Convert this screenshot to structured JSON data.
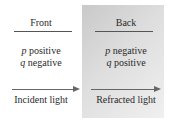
{
  "front": {
    "title": "Front",
    "p_symbol": "p",
    "p_label": " positive",
    "q_symbol": "q",
    "q_label": " negative",
    "caption": "Incident light"
  },
  "back": {
    "title": "Back",
    "p_symbol": "p",
    "p_label": " negative",
    "q_symbol": "q",
    "q_label": " positive",
    "caption": "Refracted light"
  },
  "colors": {
    "panel_dark": "#c9c9c9",
    "panel_light": "#f0f0f0",
    "arrow": "#666666"
  }
}
